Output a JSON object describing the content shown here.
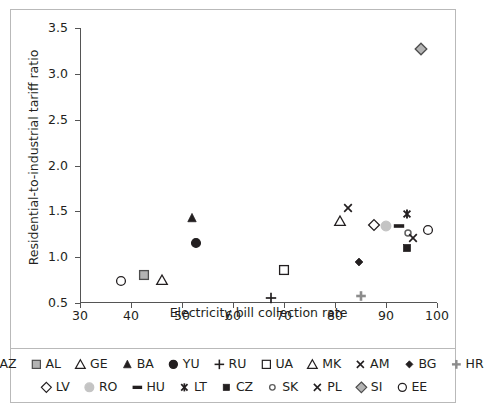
{
  "chart_data": {
    "type": "scatter",
    "title": "",
    "xlabel": "Electricity bill collection rate",
    "ylabel": "Residential-to-industrial tariff ratio",
    "xlim": [
      30,
      100
    ],
    "ylim": [
      0.5,
      3.5
    ],
    "xticks": [
      "30",
      "40",
      "50",
      "60",
      "70",
      "80",
      "90",
      "100"
    ],
    "yticks": [
      "0.5",
      "1.0",
      "1.5",
      "2.0",
      "2.5",
      "3.0",
      "3.5"
    ],
    "grid": false,
    "legend_position": "bottom",
    "points": [
      {
        "name": "AZ",
        "x": 38.0,
        "y": 0.74,
        "marker": "circle-open",
        "fill": "none",
        "stroke": "#231f20"
      },
      {
        "name": "AL",
        "x": 42.5,
        "y": 0.81,
        "marker": "square-gray",
        "fill": "#b3b3b3",
        "stroke": "#4d4d4d"
      },
      {
        "name": "GE",
        "x": 46.0,
        "y": 0.75,
        "marker": "triangle-open",
        "fill": "none",
        "stroke": "#6b6b6b"
      },
      {
        "name": "BA",
        "x": 52.0,
        "y": 1.43,
        "marker": "triangle-fill",
        "fill": "#231f20",
        "stroke": "#231f20"
      },
      {
        "name": "YU",
        "x": 52.8,
        "y": 1.15,
        "marker": "circle-fill",
        "fill": "#231f20",
        "stroke": "#231f20"
      },
      {
        "name": "RU",
        "x": 67.5,
        "y": 0.56,
        "marker": "plus",
        "fill": "none",
        "stroke": "#231f20"
      },
      {
        "name": "UA",
        "x": 70.0,
        "y": 0.86,
        "marker": "square-open",
        "fill": "none",
        "stroke": "#231f20"
      },
      {
        "name": "MK",
        "x": 81.0,
        "y": 1.4,
        "marker": "triangle-open",
        "fill": "none",
        "stroke": "#231f20"
      },
      {
        "name": "AM",
        "x": 82.6,
        "y": 1.54,
        "marker": "cross-x",
        "fill": "none",
        "stroke": "#231f20"
      },
      {
        "name": "BG",
        "x": 84.8,
        "y": 0.95,
        "marker": "diamond-fill",
        "fill": "#231f20",
        "stroke": "#231f20"
      },
      {
        "name": "HR",
        "x": 85.0,
        "y": 0.58,
        "marker": "plus-gray",
        "fill": "none",
        "stroke": "#8c8c8c"
      },
      {
        "name": "LV",
        "x": 87.6,
        "y": 1.35,
        "marker": "diamond-open",
        "fill": "none",
        "stroke": "#231f20"
      },
      {
        "name": "RO",
        "x": 90.0,
        "y": 1.34,
        "marker": "circle-gray",
        "fill": "#c4c4c4",
        "stroke": "#c4c4c4"
      },
      {
        "name": "HU",
        "x": 92.6,
        "y": 1.34,
        "marker": "dash",
        "fill": "#231f20",
        "stroke": "#231f20"
      },
      {
        "name": "LT",
        "x": 94.1,
        "y": 1.47,
        "marker": "asterisk",
        "fill": "none",
        "stroke": "#231f20"
      },
      {
        "name": "CZ",
        "x": 94.1,
        "y": 1.1,
        "marker": "square-fill",
        "fill": "#231f20",
        "stroke": "#231f20"
      },
      {
        "name": "SK",
        "x": 94.3,
        "y": 1.26,
        "marker": "circle-small-gray",
        "fill": "none",
        "stroke": "#5e5e5e"
      },
      {
        "name": "PL",
        "x": 95.3,
        "y": 1.21,
        "marker": "cross-x",
        "fill": "none",
        "stroke": "#231f20"
      },
      {
        "name": "SI",
        "x": 96.9,
        "y": 3.27,
        "marker": "diamond-gray",
        "fill": "#b3b3b3",
        "stroke": "#4d4d4d"
      },
      {
        "name": "EE",
        "x": 98.2,
        "y": 1.3,
        "marker": "circle-open",
        "fill": "none",
        "stroke": "#231f20"
      }
    ]
  },
  "legend": {
    "rows": [
      [
        {
          "label": "AZ",
          "marker": "circle-open"
        },
        {
          "label": "AL",
          "marker": "square-gray"
        },
        {
          "label": "GE",
          "marker": "triangle-open"
        },
        {
          "label": "BA",
          "marker": "triangle-fill"
        },
        {
          "label": "YU",
          "marker": "circle-fill"
        },
        {
          "label": "RU",
          "marker": "plus"
        },
        {
          "label": "UA",
          "marker": "square-open"
        },
        {
          "label": "MK",
          "marker": "triangle-open"
        },
        {
          "label": "AM",
          "marker": "cross-x"
        },
        {
          "label": "BG",
          "marker": "diamond-fill"
        },
        {
          "label": "HR",
          "marker": "plus-gray"
        }
      ],
      [
        {
          "label": "LV",
          "marker": "diamond-open"
        },
        {
          "label": "RO",
          "marker": "circle-gray"
        },
        {
          "label": "HU",
          "marker": "dash"
        },
        {
          "label": "LT",
          "marker": "asterisk"
        },
        {
          "label": "CZ",
          "marker": "square-fill"
        },
        {
          "label": "SK",
          "marker": "circle-small-gray"
        },
        {
          "label": "PL",
          "marker": "cross-x"
        },
        {
          "label": "SI",
          "marker": "diamond-gray"
        },
        {
          "label": "EE",
          "marker": "circle-open"
        }
      ]
    ]
  },
  "colors": {
    "ink": "#231f20",
    "axis": "#555555",
    "frame": "#b9b9b9",
    "gray_fill": "#b3b3b3",
    "light_gray_fill": "#c4c4c4"
  }
}
